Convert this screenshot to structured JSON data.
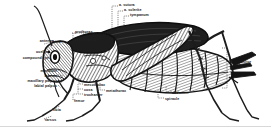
{
  "diagram": {
    "style": "engraving",
    "background_color": "#ffffff",
    "ink_color": "#141414",
    "labels": [
      {
        "id": "a-sutura",
        "text": "a. sutura",
        "x": 119,
        "y": 3,
        "align": "left"
      },
      {
        "id": "a-sclerite",
        "text": "a. sclerite",
        "x": 124,
        "y": 8,
        "align": "left"
      },
      {
        "id": "tympanum",
        "text": "tympanum",
        "x": 130,
        "y": 13,
        "align": "left"
      },
      {
        "id": "prothorax",
        "text": "prothorax",
        "x": 75,
        "y": 30,
        "align": "left"
      },
      {
        "id": "head",
        "text": "head",
        "x": 52,
        "y": 40,
        "align": "left"
      },
      {
        "id": "antenna",
        "text": "antenna",
        "x": 54,
        "y": 39,
        "align": "right"
      },
      {
        "id": "ocellus",
        "text": "ocellus",
        "x": 49,
        "y": 50,
        "align": "right"
      },
      {
        "id": "compound-eye",
        "text": "compound eye",
        "x": 49,
        "y": 56,
        "align": "right"
      },
      {
        "id": "mandible",
        "text": "mandible",
        "x": 57,
        "y": 69,
        "align": "right"
      },
      {
        "id": "labrum",
        "text": "labrum",
        "x": 57,
        "y": 74,
        "align": "right"
      },
      {
        "id": "maxillary-palpus",
        "text": "maxillary palpus",
        "x": 57,
        "y": 79,
        "align": "right"
      },
      {
        "id": "labial-palpus",
        "text": "labial palpus",
        "x": 57,
        "y": 84,
        "align": "right"
      },
      {
        "id": "mesothorax",
        "text": "mesothorax",
        "x": 84,
        "y": 83,
        "align": "left"
      },
      {
        "id": "coxa",
        "text": "coxa",
        "x": 84,
        "y": 88,
        "align": "left"
      },
      {
        "id": "trochanter",
        "text": "trochanter",
        "x": 84,
        "y": 93,
        "align": "left"
      },
      {
        "id": "metathorax",
        "text": "metathorax",
        "x": 106,
        "y": 89,
        "align": "left"
      },
      {
        "id": "femur",
        "text": "femur",
        "x": 74,
        "y": 99,
        "align": "left"
      },
      {
        "id": "tibia",
        "text": "tibia",
        "x": 53,
        "y": 108,
        "align": "left"
      },
      {
        "id": "tarsus",
        "text": "tarsus",
        "x": 45,
        "y": 118,
        "align": "left"
      },
      {
        "id": "abdomen",
        "text": "abdomen",
        "x": 172,
        "y": 91,
        "align": "left"
      },
      {
        "id": "spiracle",
        "text": "spiracle",
        "x": 165,
        "y": 97,
        "align": "left"
      },
      {
        "id": "ovipositor",
        "text": "ovipositor",
        "x": 233,
        "y": 60,
        "align": "left"
      }
    ]
  }
}
